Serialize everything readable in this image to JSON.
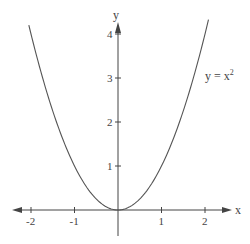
{
  "chart_data": {
    "type": "line",
    "title": "",
    "xlabel": "x",
    "ylabel": "y",
    "xlim": [
      -2.4,
      2.6
    ],
    "ylim": [
      -0.6,
      4.5
    ],
    "grid": false,
    "x_ticks": [
      -2,
      -1,
      1,
      2
    ],
    "x_tick_labels": [
      "-2",
      "-1",
      "1",
      "2"
    ],
    "y_ticks": [
      1,
      2,
      3,
      4
    ],
    "y_tick_labels": [
      "1",
      "2",
      "3",
      "4"
    ],
    "series": [
      {
        "name": "y = x²",
        "function": "x^2",
        "domain": [
          -2.05,
          2.08
        ],
        "x": [
          -2,
          -1.5,
          -1,
          -0.5,
          0,
          0.5,
          1,
          1.5,
          2
        ],
        "y": [
          4,
          2.25,
          1,
          0.25,
          0,
          0.25,
          1,
          2.25,
          4
        ]
      }
    ],
    "annotations": [
      {
        "text": "y = x²",
        "x": 2.0,
        "y": 3.05
      }
    ],
    "colors": {
      "axis": "#444444",
      "curve": "#555555",
      "background": "#ffffff"
    }
  },
  "labels": {
    "x_axis": "x",
    "y_axis": "y",
    "curve_label": "y = x",
    "curve_label_exp": "2"
  }
}
